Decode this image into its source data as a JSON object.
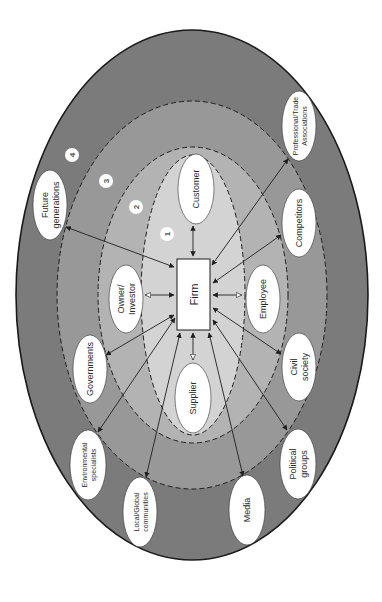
{
  "diagram": {
    "center": {
      "label": "Firm"
    },
    "ring_labels": [
      "1",
      "2",
      "3",
      "4"
    ],
    "colors": {
      "outer_ring": "#7b7b7b",
      "ring_3": "#989898",
      "ring_2": "#b3b3b3",
      "ring_1": "#d3d3d3",
      "node_fill": "#ffffff",
      "stroke": "#1f1f1f"
    },
    "stakeholders": [
      {
        "id": "customer",
        "lines": [
          "Customer"
        ],
        "ring": 1
      },
      {
        "id": "owner-investor",
        "lines": [
          "Owner/",
          "Investor"
        ],
        "ring": 1
      },
      {
        "id": "employee",
        "lines": [
          "Employee"
        ],
        "ring": 1
      },
      {
        "id": "supplier",
        "lines": [
          "Supplier"
        ],
        "ring": 1
      },
      {
        "id": "competitors",
        "lines": [
          "Competitors"
        ],
        "ring": 3
      },
      {
        "id": "governments",
        "lines": [
          "Governments"
        ],
        "ring": 3
      },
      {
        "id": "civil-society",
        "lines": [
          "Civil",
          "society"
        ],
        "ring": 3
      },
      {
        "id": "future-generations",
        "lines": [
          "Future",
          "generations"
        ],
        "ring": 4
      },
      {
        "id": "professional-trade-associations",
        "lines": [
          "Professional/Trade",
          "Associations"
        ],
        "ring": 4
      },
      {
        "id": "environmental-specialists",
        "lines": [
          "Environmental",
          "specialists"
        ],
        "ring": 4
      },
      {
        "id": "local-global-communities",
        "lines": [
          "Local/Global",
          "communities"
        ],
        "ring": 4
      },
      {
        "id": "media",
        "lines": [
          "Media"
        ],
        "ring": 4
      },
      {
        "id": "political-groups",
        "lines": [
          "Political",
          "groups"
        ],
        "ring": 4
      }
    ]
  }
}
